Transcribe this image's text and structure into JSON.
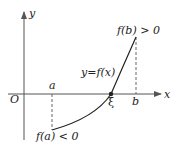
{
  "diagram": {
    "axes": {
      "x_label": "x",
      "y_label": "y",
      "origin_label": "O"
    },
    "points": {
      "a_label": "a",
      "b_label": "b",
      "root_label": "ξ"
    },
    "curve_label": "y=f(x)",
    "annotations": {
      "fa": "f(a) < 0",
      "fb": "f(b) > 0"
    },
    "colors": {
      "axis": "#555555",
      "curve": "#222222",
      "dash": "#666666"
    }
  }
}
